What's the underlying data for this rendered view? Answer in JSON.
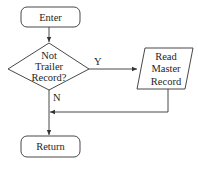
{
  "diagram": {
    "type": "flowchart",
    "nodes": {
      "enter": {
        "shape": "terminator",
        "label": "Enter"
      },
      "decision": {
        "shape": "diamond",
        "lines": [
          "Not",
          "Trailer",
          "Record?"
        ]
      },
      "read": {
        "shape": "parallelogram",
        "lines": [
          "Read",
          "Master",
          "Record"
        ]
      },
      "return": {
        "shape": "terminator",
        "label": "Return"
      }
    },
    "edges": {
      "yes_label": "Y",
      "no_label": "N"
    },
    "colors": {
      "stroke": "#333333",
      "text": "#1e1e1e",
      "background": "#ffffff"
    }
  }
}
